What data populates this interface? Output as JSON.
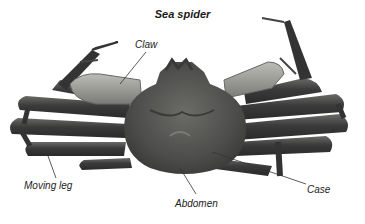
{
  "diagram": {
    "title": "Sea spider",
    "labels": [
      {
        "id": "claw",
        "text": "Claw"
      },
      {
        "id": "moving_leg",
        "text": "Moving leg"
      },
      {
        "id": "abdomen",
        "text": "Abdomen"
      },
      {
        "id": "case",
        "text": "Case"
      }
    ],
    "colors": {
      "body": "#4a4a48",
      "leg": "#3a3a3a",
      "claw": "#9a9a96",
      "leader_line": "#333333",
      "background": "#ffffff"
    }
  }
}
